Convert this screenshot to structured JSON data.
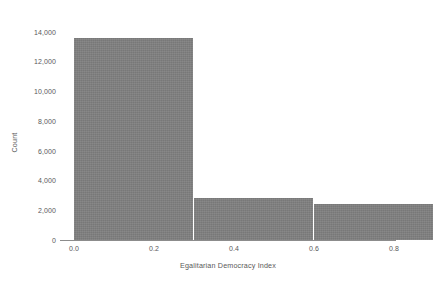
{
  "chart_data": {
    "type": "bar",
    "title": "",
    "xlabel": "Egalitarian Democracy Index",
    "ylabel": "Count",
    "grid": false,
    "legend": false,
    "bin_width": 0.3,
    "bin_edges": [
      0.0,
      0.3,
      0.6,
      0.9
    ],
    "categories": [
      "0.0-0.3",
      "0.3-0.6",
      "0.6-0.9"
    ],
    "values": [
      13600,
      2840,
      2450
    ],
    "bar_color": "#808080",
    "xlim": [
      -0.035,
      0.805
    ],
    "ylim": [
      0,
      14850
    ],
    "xticks": [
      0.0,
      0.2,
      0.4,
      0.6,
      0.8
    ],
    "xticklabels": [
      "0.0",
      "0.2",
      "0.4",
      "0.6",
      "0.8"
    ],
    "yticks": [
      0,
      2000,
      4000,
      6000,
      8000,
      10000,
      12000,
      14000
    ],
    "yticklabels": [
      "0",
      "2,000",
      "4,000",
      "6,000",
      "8,000",
      "10,000",
      "12,000",
      "14,000"
    ],
    "text_color": "#595959",
    "axis_color": "#8c8c8c"
  }
}
